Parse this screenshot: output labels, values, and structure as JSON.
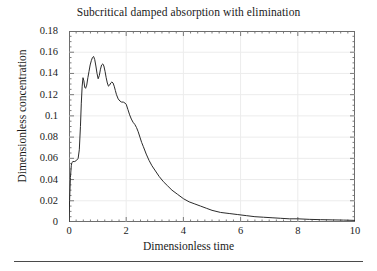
{
  "figure": {
    "title": "Subcritical damped absorption with elimination",
    "xaxis_title": "Dimensionless time",
    "yaxis_title": "Dimensionless concentration"
  },
  "chart_data": {
    "type": "line",
    "title": "Subcritical damped absorption with elimination",
    "xlabel": "Dimensionless time",
    "ylabel": "Dimensionless concentration",
    "xlim": [
      0,
      10
    ],
    "ylim": [
      0,
      0.18
    ],
    "xticks": [
      0,
      2,
      4,
      6,
      8,
      10
    ],
    "xtick_labels": [
      "0",
      "2",
      "4",
      "6",
      "8",
      "10"
    ],
    "x_minor_tick_step": 0.25,
    "yticks": [
      0,
      0.02,
      0.04,
      0.06,
      0.08,
      0.1,
      0.12,
      0.14,
      0.16,
      0.18
    ],
    "ytick_labels": [
      "0",
      "0.02",
      "0.04",
      "0.06",
      "0.08",
      "0.1",
      "0.12",
      "0.14",
      "0.16",
      "0.18"
    ],
    "y_minor_tick_step": 0.005,
    "grid": true,
    "grid_color": "#ececec",
    "legend": false,
    "line_color": "#2b2b2b",
    "line_width": 1.0,
    "series": [
      {
        "name": "Dimensionless concentration",
        "x": [
          0.0,
          0.02,
          0.05,
          0.08,
          0.1,
          0.14,
          0.2,
          0.26,
          0.32,
          0.36,
          0.4,
          0.43,
          0.46,
          0.49,
          0.52,
          0.55,
          0.58,
          0.62,
          0.66,
          0.7,
          0.74,
          0.78,
          0.82,
          0.86,
          0.9,
          0.94,
          0.98,
          1.02,
          1.06,
          1.1,
          1.14,
          1.18,
          1.22,
          1.26,
          1.3,
          1.34,
          1.38,
          1.42,
          1.46,
          1.5,
          1.54,
          1.58,
          1.62,
          1.66,
          1.72,
          1.78,
          1.84,
          1.9,
          1.96,
          2.0,
          2.06,
          2.12,
          2.18,
          2.24,
          2.3,
          2.36,
          2.42,
          2.48,
          2.54,
          2.6,
          2.7,
          2.8,
          2.9,
          3.0,
          3.15,
          3.3,
          3.45,
          3.6,
          3.8,
          4.0,
          4.2,
          4.4,
          4.6,
          4.8,
          5.0,
          5.3,
          5.6,
          5.9,
          6.2,
          6.5,
          6.8,
          7.1,
          7.4,
          7.7,
          8.0,
          8.4,
          8.8,
          9.2,
          9.6,
          10.0
        ],
        "y": [
          0.0,
          0.02,
          0.042,
          0.053,
          0.056,
          0.057,
          0.057,
          0.058,
          0.06,
          0.068,
          0.09,
          0.112,
          0.128,
          0.136,
          0.133,
          0.127,
          0.126,
          0.129,
          0.136,
          0.142,
          0.148,
          0.152,
          0.155,
          0.156,
          0.153,
          0.147,
          0.14,
          0.135,
          0.138,
          0.144,
          0.148,
          0.149,
          0.147,
          0.142,
          0.136,
          0.131,
          0.128,
          0.129,
          0.131,
          0.132,
          0.131,
          0.128,
          0.124,
          0.12,
          0.116,
          0.114,
          0.113,
          0.113,
          0.112,
          0.111,
          0.106,
          0.101,
          0.097,
          0.094,
          0.092,
          0.089,
          0.085,
          0.08,
          0.075,
          0.071,
          0.064,
          0.058,
          0.053,
          0.049,
          0.043,
          0.038,
          0.034,
          0.03,
          0.026,
          0.022,
          0.019,
          0.017,
          0.015,
          0.013,
          0.011,
          0.009,
          0.008,
          0.007,
          0.006,
          0.005,
          0.0045,
          0.004,
          0.0035,
          0.003,
          0.003,
          0.0025,
          0.0022,
          0.002,
          0.0018,
          0.0015
        ]
      }
    ]
  }
}
